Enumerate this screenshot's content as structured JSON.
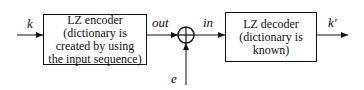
{
  "diagram": {
    "input_label": "k",
    "encoder": {
      "lines": [
        "LZ encoder",
        "(dictionary is",
        "created by using",
        "the input sequence)"
      ]
    },
    "encoder_output_label": "out",
    "adder_symbol": "⊕",
    "error_label": "e",
    "decoder_input_label": "in",
    "decoder": {
      "lines": [
        "LZ decoder",
        "(dictionary is",
        "known)"
      ]
    },
    "output_label": "k′"
  }
}
